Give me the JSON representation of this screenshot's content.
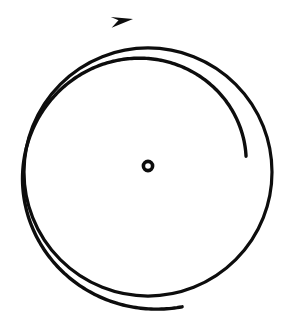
{
  "figure": {
    "background_color": "#ffffff",
    "ink_color": "#0d0d0d",
    "canvas": {
      "width": 303,
      "height": 325
    }
  },
  "chart_data": {
    "type": "scatter",
    "subtitle": "",
    "xlabel": "",
    "ylabel": "",
    "xlim": [
      0,
      303
    ],
    "ylim": [
      0,
      325
    ],
    "grid": false,
    "legend": null,
    "annotations": [],
    "tick_labels": {
      "x": [],
      "y": []
    },
    "series": [
      {
        "name": "inner-circle",
        "kind": "closed-circle",
        "center": [
          148,
          172
        ],
        "radius": 124,
        "stroke_width": 3.2,
        "closed": true
      },
      {
        "name": "outer-spiral-arrow",
        "kind": "spiral-arc",
        "center": [
          148,
          170
        ],
        "start_radius": 99,
        "end_radius": 141,
        "start_angle_deg": 8,
        "end_angle_deg": 284,
        "direction": "counterclockwise",
        "stroke_width": 3.4,
        "free_end": [
          244,
          184
        ],
        "arrow_tip": [
          133,
          19
        ]
      },
      {
        "name": "center-point-marker",
        "kind": "ring",
        "center": [
          148,
          166
        ],
        "radius": 4.6,
        "stroke_width": 3.6
      }
    ],
    "arrow": {
      "tip": [
        133,
        19
      ],
      "direction": "left",
      "head_length": 22,
      "head_half_width": 7,
      "style": "solid-triangle"
    }
  },
  "elements": {
    "inner_circle_label": "inner circle outline",
    "outer_spiral_label": "outer spiral rotation arrow",
    "center_marker_label": "center point marker",
    "arrow_head_label": "counterclockwise arrowhead"
  }
}
